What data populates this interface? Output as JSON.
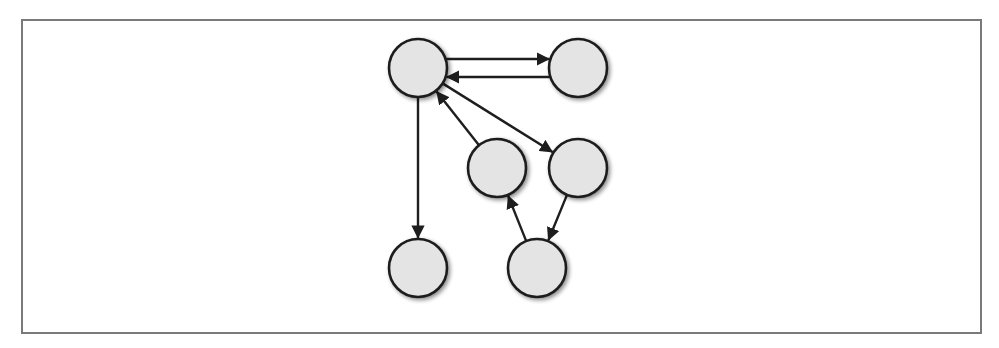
{
  "diagram": {
    "type": "directed-graph",
    "colors": {
      "node_fill": "#e4e4e4",
      "node_stroke": "#1e1e1e",
      "edge": "#1e1e1e",
      "frame": "#7a7a7a",
      "shadow": "#9a9a9a"
    },
    "node_radius": 29,
    "nodes": [
      {
        "id": "n1",
        "x": 418,
        "y": 68
      },
      {
        "id": "n2",
        "x": 578,
        "y": 68
      },
      {
        "id": "n3",
        "x": 497,
        "y": 168
      },
      {
        "id": "n4",
        "x": 578,
        "y": 168
      },
      {
        "id": "n5",
        "x": 418,
        "y": 268
      },
      {
        "id": "n6",
        "x": 537,
        "y": 268
      }
    ],
    "edges": [
      {
        "from": "n1",
        "to": "n2",
        "offset": -9
      },
      {
        "from": "n2",
        "to": "n1",
        "offset": -9
      },
      {
        "from": "n1",
        "to": "n4",
        "offset": 0
      },
      {
        "from": "n3",
        "to": "n1",
        "offset": 0
      },
      {
        "from": "n1",
        "to": "n5",
        "offset": 0
      },
      {
        "from": "n4",
        "to": "n6",
        "offset": 0
      },
      {
        "from": "n6",
        "to": "n3",
        "offset": 0
      }
    ]
  }
}
